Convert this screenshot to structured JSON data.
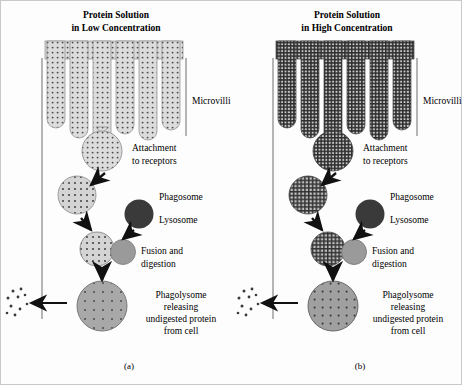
{
  "figure": {
    "background_color": "#fdfdfd",
    "border_color": "#c9c9c9",
    "ink_color": "#1a1a1a"
  },
  "panels": [
    {
      "id": "a",
      "caption": "(a)",
      "title_line1": "Protein Solution",
      "title_line2": "in Low Concentration",
      "concentration": "low",
      "fill_color": "#d9d9d9",
      "pattern": "sparse-dots",
      "lysosome_color": "#3a3a3a",
      "digest_color": "#9a9a9a",
      "phagolysosome_color": "#a8a8a8",
      "microvilli_count": 6,
      "labels": {
        "microvilli": "Microvilli",
        "attachment_line1": "Attachment",
        "attachment_line2": "to receptors",
        "phagosome": "Phagosome",
        "lysosome": "Lysosome",
        "fusion_line1": "Fusion and",
        "fusion_line2": "digestion",
        "release_line1": "Phagolysome",
        "release_line2": "releasing",
        "release_line3": "undigested protein",
        "release_line4": "from cell"
      }
    },
    {
      "id": "b",
      "caption": "(b)",
      "title_line1": "Protein Solution",
      "title_line2": "in High Concentration",
      "concentration": "high",
      "fill_color": "#c4c4c4",
      "pattern": "dense-grid",
      "lysosome_color": "#3a3a3a",
      "digest_color": "#9a9a9a",
      "phagolysosome_color": "#a0a0a0",
      "microvilli_count": 6,
      "labels": {
        "microvilli": "Microvilli",
        "attachment_line1": "Attachment",
        "attachment_line2": "to receptors",
        "phagosome": "Phagosome",
        "lysosome": "Lysosome",
        "fusion_line1": "Fusion and",
        "fusion_line2": "digestion",
        "release_line1": "Phagolysome",
        "release_line2": "releasing",
        "release_line3": "undigested protein",
        "release_line4": "from cell"
      }
    }
  ]
}
